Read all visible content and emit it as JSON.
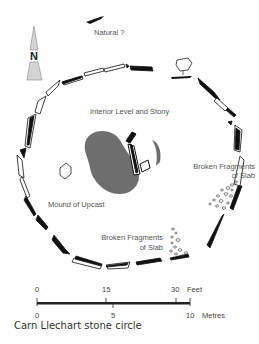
{
  "figure": {
    "caption": "Carn Llechart stone circle",
    "north_arrow": {
      "letter": "N"
    },
    "labels": {
      "natural": "Natural ?",
      "interior": "Interior Level and Stony",
      "mound": "Mound of Upcast",
      "broken_right_line1": "Broken Fragments",
      "broken_right_line2": "of Slab",
      "broken_bottom_line1": "Broken Fragments",
      "broken_bottom_line2": "of Slab"
    },
    "scale": {
      "feet_ticks": [
        "0",
        "15",
        "30"
      ],
      "feet_unit": "Feet",
      "metre_ticks": [
        "0",
        "5",
        "10"
      ],
      "metre_unit": "Metres"
    },
    "colors": {
      "stone": "#111111",
      "mound_fill": "#6e6e6e",
      "arrow_fill": "#d4d4d4",
      "text": "#555555"
    }
  }
}
